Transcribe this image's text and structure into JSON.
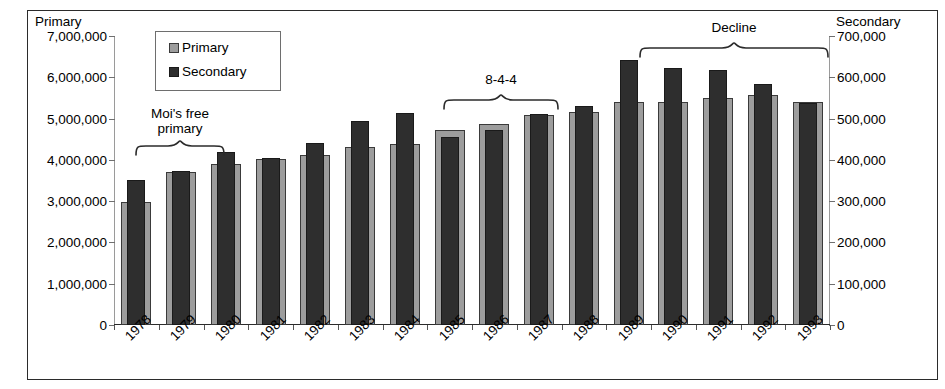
{
  "chart_data": {
    "type": "bar",
    "title": "",
    "subtitle": "",
    "xlabel": "",
    "ylabel": "Primary",
    "y2label": "Secondary",
    "grid": false,
    "legend_position": "top-left",
    "ylim": [
      0,
      7000000
    ],
    "y2lim": [
      0,
      700000
    ],
    "yticks": [
      "0",
      "1,000,000",
      "2,000,000",
      "3,000,000",
      "4,000,000",
      "5,000,000",
      "6,000,000",
      "7,000,000"
    ],
    "ytick_values": [
      0,
      1000000,
      2000000,
      3000000,
      4000000,
      5000000,
      6000000,
      7000000
    ],
    "y2ticks": [
      "0",
      "100,000",
      "200,000",
      "300,000",
      "400,000",
      "500,000",
      "600,000",
      "700,000"
    ],
    "y2tick_values": [
      0,
      100000,
      200000,
      300000,
      400000,
      500000,
      600000,
      700000
    ],
    "categories": [
      "1978",
      "1979",
      "1980",
      "1981",
      "1982",
      "1983",
      "1984",
      "1985",
      "1986",
      "1987",
      "1988",
      "1989",
      "1990",
      "1991",
      "1992",
      "1993"
    ],
    "series": [
      {
        "name": "Primary",
        "axis": "left",
        "color": "#9d9d9d",
        "values": [
          2980000,
          3700000,
          3890000,
          4020000,
          4110000,
          4320000,
          4390000,
          4720000,
          4860000,
          5080000,
          5150000,
          5400000,
          5400000,
          5490000,
          5580000,
          5400000
        ]
      },
      {
        "name": "Secondary",
        "axis": "right",
        "color": "#2e2e2e",
        "values": [
          352000,
          372000,
          419000,
          404000,
          440000,
          495000,
          513000,
          456000,
          473000,
          510000,
          530000,
          643000,
          622000,
          618000,
          583000,
          538000
        ]
      }
    ],
    "annotations": [
      {
        "id": "moi-free-primary",
        "text": "Moi's free\nprimary",
        "brace_span": [
          "1978",
          "1979"
        ]
      },
      {
        "id": "eight-four-four",
        "text": "8-4-4",
        "brace_span": [
          "1985",
          "1986"
        ]
      },
      {
        "id": "decline",
        "text": "Decline",
        "brace_span": [
          "1990",
          "1993"
        ]
      }
    ]
  },
  "axes": {
    "left_title": "Primary",
    "right_title": "Secondary"
  },
  "legend": {
    "items": [
      {
        "label": "Primary",
        "color": "#9d9d9d"
      },
      {
        "label": "Secondary",
        "color": "#2e2e2e"
      }
    ]
  },
  "annotations": {
    "moi": {
      "line1": "Moi's free",
      "line2": "primary"
    },
    "system": {
      "label": "8-4-4"
    },
    "decline": {
      "label": "Decline"
    }
  }
}
